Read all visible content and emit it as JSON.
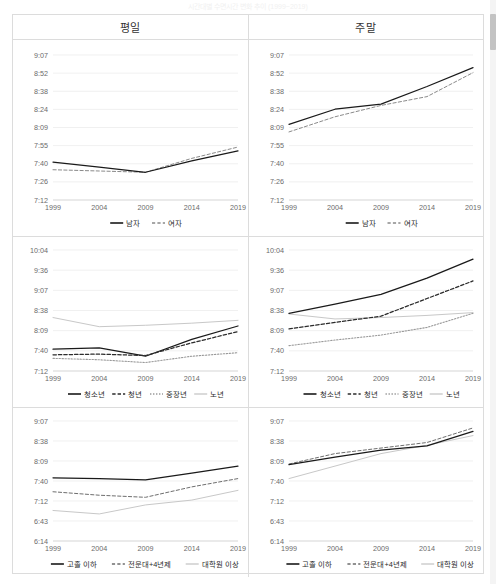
{
  "page": {
    "faint_header": "시간대별 수면시간 변화 추이 (1999~2019)"
  },
  "table": {
    "columns": [
      {
        "id": "weekday",
        "label": "평일"
      },
      {
        "id": "weekend",
        "label": "주말"
      }
    ]
  },
  "colors": {
    "solid_black": "#1a1a1a",
    "dashed_gray": "#8a8a8a",
    "dotted_dark": "#2b2b2b",
    "light_gray": "#c8c8c8",
    "grid": "#eaeaea",
    "axis_text": "#6b6b6b",
    "border": "#dcdcdc"
  },
  "chart_data": [
    {
      "id": "gender-weekday",
      "type": "line",
      "title": "평일",
      "xlabel": "",
      "ylabel": "",
      "x": [
        1999,
        2004,
        2009,
        2014,
        2019
      ],
      "categories": [
        "1999",
        "2004",
        "2009",
        "2014",
        "2019"
      ],
      "yticks": [
        "7:12",
        "7:26",
        "7:40",
        "7:55",
        "8:09",
        "8:24",
        "8:38",
        "8:52",
        "9:07"
      ],
      "ylim_min_minutes": 432,
      "ylim_max_minutes": 547,
      "grid": true,
      "legend_position": "bottom",
      "series": [
        {
          "name": "남자",
          "style": "solid",
          "color": "#1a1a1a",
          "values_text": [
            "7:42",
            "7:38",
            "7:34",
            "7:43",
            "7:51"
          ],
          "values": [
            462,
            458,
            454,
            463,
            471
          ]
        },
        {
          "name": "여자",
          "style": "dashed",
          "color": "#8a8a8a",
          "values_text": [
            "7:36",
            "7:35",
            "7:34",
            "7:45",
            "7:54"
          ],
          "values": [
            456,
            455,
            454,
            465,
            474
          ]
        }
      ]
    },
    {
      "id": "gender-weekend",
      "type": "line",
      "title": "주말",
      "xlabel": "",
      "ylabel": "",
      "x": [
        1999,
        2004,
        2009,
        2014,
        2019
      ],
      "categories": [
        "1999",
        "2004",
        "2009",
        "2014",
        "2019"
      ],
      "yticks": [
        "7:12",
        "7:26",
        "7:40",
        "7:55",
        "8:09",
        "8:24",
        "8:38",
        "8:52",
        "9:07"
      ],
      "ylim_min_minutes": 432,
      "ylim_max_minutes": 547,
      "grid": true,
      "legend_position": "bottom",
      "series": [
        {
          "name": "남자",
          "style": "solid",
          "color": "#1a1a1a",
          "values_text": [
            "8:12",
            "8:24",
            "8:28",
            "8:42",
            "8:57"
          ],
          "values": [
            492,
            504,
            508,
            522,
            537
          ]
        },
        {
          "name": "여자",
          "style": "dashed",
          "color": "#8a8a8a",
          "values_text": [
            "8:06",
            "8:18",
            "8:27",
            "8:34",
            "8:53"
          ],
          "values": [
            486,
            498,
            507,
            514,
            533
          ]
        }
      ]
    },
    {
      "id": "age-weekday",
      "type": "line",
      "title": "평일",
      "xlabel": "",
      "ylabel": "",
      "x": [
        1999,
        2004,
        2009,
        2014,
        2019
      ],
      "categories": [
        "1999",
        "2004",
        "2009",
        "2014",
        "2019"
      ],
      "yticks": [
        "7:12",
        "7:40",
        "8:09",
        "8:38",
        "9:07",
        "9:36",
        "10:04"
      ],
      "ylim_min_minutes": 432,
      "ylim_max_minutes": 604,
      "grid": true,
      "legend_position": "bottom",
      "series": [
        {
          "name": "청소년",
          "style": "solid",
          "color": "#1a1a1a",
          "values_text": [
            "7:43",
            "7:45",
            "7:33",
            "7:57",
            "8:16"
          ],
          "values": [
            463,
            465,
            453,
            477,
            496
          ]
        },
        {
          "name": "청년",
          "style": "dashed-bold",
          "color": "#2b2b2b",
          "values_text": [
            "7:35",
            "7:36",
            "7:34",
            "7:52",
            "8:08"
          ],
          "values": [
            455,
            456,
            454,
            472,
            488
          ]
        },
        {
          "name": "중장년",
          "style": "dotted",
          "color": "#9a9a9a",
          "values_text": [
            "7:30",
            "7:28",
            "7:24",
            "7:33",
            "7:38"
          ],
          "values": [
            450,
            448,
            444,
            453,
            458
          ]
        },
        {
          "name": "노년",
          "style": "solid-light",
          "color": "#c8c8c8",
          "values_text": [
            "8:28",
            "8:15",
            "8:17",
            "8:20",
            "8:24"
          ],
          "values": [
            508,
            495,
            497,
            500,
            504
          ]
        }
      ]
    },
    {
      "id": "age-weekend",
      "type": "line",
      "title": "주말",
      "xlabel": "",
      "ylabel": "",
      "x": [
        1999,
        2004,
        2009,
        2014,
        2019
      ],
      "categories": [
        "1999",
        "2004",
        "2009",
        "2014",
        "2019"
      ],
      "yticks": [
        "7:12",
        "7:40",
        "8:09",
        "8:38",
        "9:07",
        "9:36",
        "10:04"
      ],
      "ylim_min_minutes": 432,
      "ylim_max_minutes": 604,
      "grid": true,
      "legend_position": "bottom",
      "series": [
        {
          "name": "청소년",
          "style": "solid",
          "color": "#1a1a1a",
          "values_text": [
            "8:34",
            "8:47",
            "9:01",
            "9:24",
            "9:51"
          ],
          "values": [
            514,
            527,
            541,
            564,
            591
          ]
        },
        {
          "name": "청년",
          "style": "dashed-bold",
          "color": "#2b2b2b",
          "values_text": [
            "8:12",
            "8:21",
            "8:30",
            "8:55",
            "9:20"
          ],
          "values": [
            492,
            501,
            510,
            535,
            560
          ]
        },
        {
          "name": "중장년",
          "style": "dotted",
          "color": "#9a9a9a",
          "values_text": [
            "7:48",
            "7:56",
            "8:03",
            "8:14",
            "8:34"
          ],
          "values": [
            468,
            476,
            483,
            494,
            514
          ]
        },
        {
          "name": "노년",
          "style": "solid-light",
          "color": "#c8c8c8",
          "values_text": [
            "8:33",
            "8:26",
            "8:28",
            "8:31",
            "8:35"
          ],
          "values": [
            513,
            506,
            508,
            511,
            515
          ]
        }
      ]
    },
    {
      "id": "education-weekday",
      "type": "line",
      "title": "평일",
      "xlabel": "",
      "ylabel": "",
      "x": [
        1999,
        2004,
        2009,
        2014,
        2019
      ],
      "categories": [
        "1999",
        "2004",
        "2009",
        "2014",
        "2019"
      ],
      "yticks": [
        "6:14",
        "6:43",
        "7:12",
        "7:40",
        "8:09",
        "8:38",
        "9:07"
      ],
      "ylim_min_minutes": 374,
      "ylim_max_minutes": 547,
      "grid": true,
      "legend_position": "bottom",
      "series": [
        {
          "name": "고졸 이하",
          "style": "solid",
          "color": "#1a1a1a",
          "values_text": [
            "7:45",
            "7:44",
            "7:42",
            "7:52",
            "8:02"
          ],
          "values": [
            465,
            464,
            462,
            472,
            482
          ]
        },
        {
          "name": "전문대+4년제",
          "style": "dashed",
          "color": "#6e6e6e",
          "values_text": [
            "7:25",
            "7:20",
            "7:17",
            "7:32",
            "7:44"
          ],
          "values": [
            445,
            440,
            437,
            452,
            464
          ]
        },
        {
          "name": "대학원 이상",
          "style": "solid-light",
          "color": "#c8c8c8",
          "values_text": [
            "6:58",
            "6:53",
            "7:06",
            "7:13",
            "7:27"
          ],
          "values": [
            418,
            413,
            426,
            433,
            447
          ]
        }
      ]
    },
    {
      "id": "education-weekend",
      "type": "line",
      "title": "주말",
      "xlabel": "",
      "ylabel": "",
      "x": [
        1999,
        2004,
        2009,
        2014,
        2019
      ],
      "categories": [
        "1999",
        "2004",
        "2009",
        "2014",
        "2019"
      ],
      "yticks": [
        "6:14",
        "6:43",
        "7:12",
        "7:40",
        "8:09",
        "8:38",
        "9:07"
      ],
      "ylim_min_minutes": 374,
      "ylim_max_minutes": 547,
      "grid": true,
      "legend_position": "bottom",
      "series": [
        {
          "name": "고졸 이하",
          "style": "solid",
          "color": "#1a1a1a",
          "values_text": [
            "8:04",
            "8:15",
            "8:25",
            "8:31",
            "8:52"
          ],
          "values": [
            484,
            495,
            505,
            511,
            532
          ]
        },
        {
          "name": "전문대+4년제",
          "style": "dashed",
          "color": "#6e6e6e",
          "values_text": [
            "8:05",
            "8:20",
            "8:28",
            "8:36",
            "8:57"
          ],
          "values": [
            485,
            500,
            508,
            516,
            537
          ]
        },
        {
          "name": "대학원 이상",
          "style": "solid-light",
          "color": "#c8c8c8",
          "values_text": [
            "7:44",
            "8:02",
            "8:20",
            "8:32",
            "8:46"
          ],
          "values": [
            464,
            482,
            500,
            512,
            526
          ]
        }
      ]
    }
  ]
}
